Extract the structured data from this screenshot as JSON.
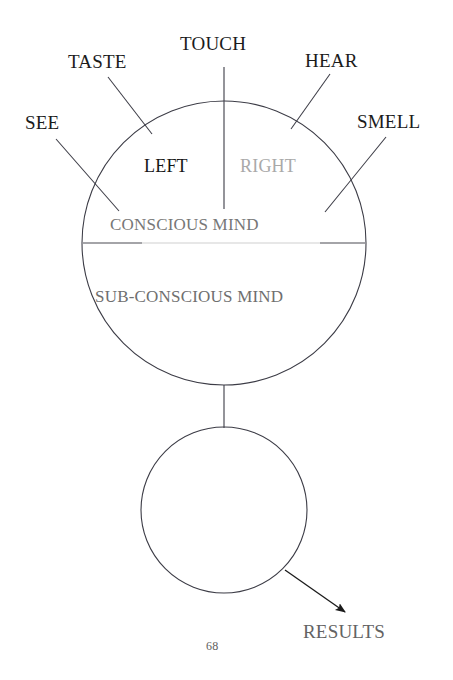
{
  "page": {
    "number": "68",
    "background_color": "#ffffff"
  },
  "diagram": {
    "title_absent": true,
    "senses": [
      {
        "label": "SEE",
        "side": "left"
      },
      {
        "label": "TASTE",
        "side": "left"
      },
      {
        "label": "TOUCH",
        "side": "center"
      },
      {
        "label": "HEAR",
        "side": "right"
      },
      {
        "label": "SMELL",
        "side": "right"
      }
    ],
    "hemispheres": {
      "left_label": "LEFT",
      "right_label": "RIGHT",
      "left_color": "#161616",
      "right_color": "#a9a9a9"
    },
    "bands": {
      "conscious_label": "CONSCIOUS MIND",
      "subconscious_label": "SUB-CONSCIOUS MIND",
      "conscious_color": "#777777",
      "subconscious_color": "#6f6f6f"
    },
    "output": {
      "label": "RESULTS",
      "color": "#636363"
    },
    "stroke_color": "#3c3c46",
    "divider_color": "#c9c9c9"
  }
}
